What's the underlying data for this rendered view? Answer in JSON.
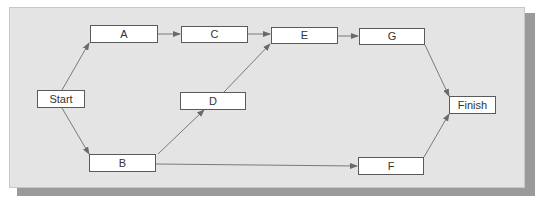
{
  "diagram": {
    "type": "network-diagram",
    "colors": {
      "panel": "#e4e4e4",
      "shadow": "#9a9a9a",
      "node_fill": "#ffffff",
      "node_border": "#5a5a5a",
      "edge": "#6a6a6a"
    },
    "nodes": {
      "start": {
        "label": "Start"
      },
      "a": {
        "label": "A"
      },
      "b": {
        "label": "B"
      },
      "c": {
        "label": "C"
      },
      "d": {
        "label": "D"
      },
      "e": {
        "label": "E"
      },
      "f": {
        "label": "F"
      },
      "g": {
        "label": "G"
      },
      "finish": {
        "label": "Finish"
      }
    },
    "edges": [
      {
        "from": "Start",
        "to": "A"
      },
      {
        "from": "Start",
        "to": "B"
      },
      {
        "from": "A",
        "to": "C"
      },
      {
        "from": "C",
        "to": "E"
      },
      {
        "from": "B",
        "to": "D"
      },
      {
        "from": "D",
        "to": "E"
      },
      {
        "from": "E",
        "to": "G"
      },
      {
        "from": "B",
        "to": "F"
      },
      {
        "from": "G",
        "to": "Finish"
      },
      {
        "from": "F",
        "to": "Finish"
      }
    ]
  }
}
